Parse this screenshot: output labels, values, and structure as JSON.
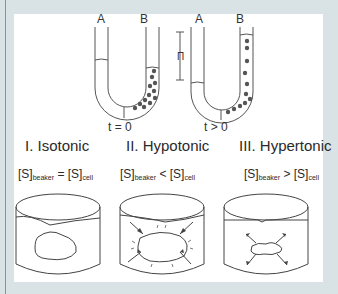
{
  "diagram": {
    "utubes": [
      {
        "arm_left": "A",
        "arm_right": "B",
        "caption": "t = 0"
      },
      {
        "arm_left": "A",
        "arm_right": "B",
        "caption": "t > 0",
        "height_label": "Π"
      }
    ],
    "conditions": [
      {
        "title": "I. Isotonic",
        "lhs": "[S]",
        "lhs_sub": "beaker",
        "op": "=",
        "rhs": "[S]",
        "rhs_sub": "cell",
        "cell_state": "unchanged"
      },
      {
        "title": "II. Hypotonic",
        "lhs": "[S]",
        "lhs_sub": "beaker",
        "op": "<",
        "rhs": "[S]",
        "rhs_sub": "cell",
        "cell_state": "swelling (arrows inward)"
      },
      {
        "title": "III. Hypertonic",
        "lhs": "[S]",
        "lhs_sub": "beaker",
        "op": ">",
        "rhs": "[S]",
        "rhs_sub": "cell",
        "cell_state": "shrinking (arrows outward)"
      }
    ],
    "colors": {
      "background": "#d9e3e6",
      "panel": "#ffffff",
      "stroke": "#444444",
      "particle": "#555555"
    }
  }
}
